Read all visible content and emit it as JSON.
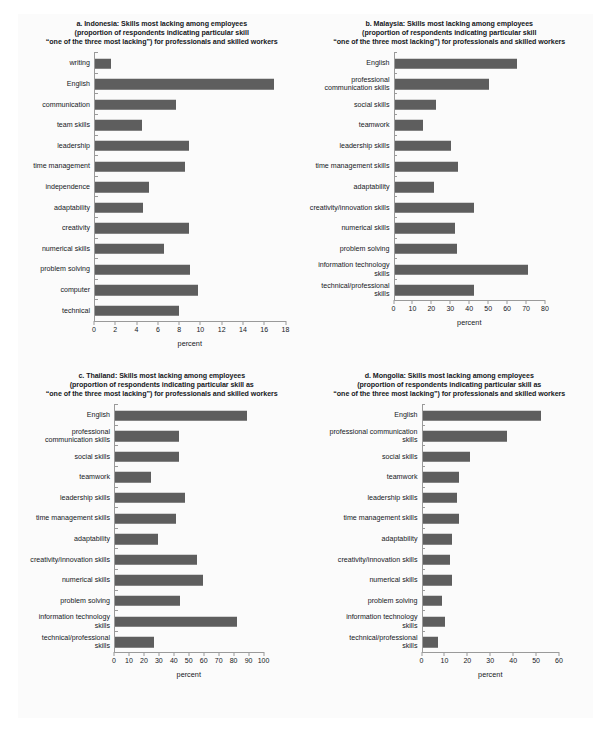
{
  "figure": {
    "bar_color": "#5e5e5e",
    "axis_color": "#9a9a9a",
    "background": "#fbfbfb",
    "page_background": "#ffffff"
  },
  "chart_data": [
    {
      "id": "a",
      "type": "bar",
      "orientation": "horizontal",
      "title_lines": [
        "a. Indonesia: Skills most lacking among employees",
        "(proportion of respondents indicating particular skill",
        "“one of the three most lacking”) for professionals and skilled workers"
      ],
      "xlabel": "percent",
      "ylabel": "",
      "xlim": [
        0,
        18
      ],
      "xticks": [
        0,
        2,
        4,
        6,
        8,
        10,
        12,
        14,
        16,
        18
      ],
      "xtick_labels": [
        "0",
        "2",
        "4",
        "6",
        "8",
        "10",
        "12",
        "14",
        "16",
        "18"
      ],
      "grid": false,
      "legend": "none",
      "categories": [
        "writing",
        "English",
        "communication",
        "team skills",
        "leadership",
        "time management",
        "independence",
        "adaptability",
        "creativity",
        "numerical skills",
        "problem solving",
        "computer",
        "technical"
      ],
      "values": [
        1.5,
        16.9,
        7.7,
        4.4,
        8.9,
        8.5,
        5.1,
        4.5,
        8.9,
        6.5,
        9.0,
        9.7,
        7.9
      ]
    },
    {
      "id": "b",
      "type": "bar",
      "orientation": "horizontal",
      "title_lines": [
        "b. Malaysia: Skills most lacking among employees",
        "(proportion of respondents indicating particular skill",
        "“one of the three most lacking”) for professionals and skilled workers"
      ],
      "xlabel": "percent",
      "ylabel": "",
      "xlim": [
        0,
        80
      ],
      "xticks": [
        0,
        10,
        20,
        30,
        40,
        50,
        60,
        70,
        80
      ],
      "xtick_labels": [
        "0",
        "10",
        "20",
        "30",
        "40",
        "50",
        "60",
        "70",
        "80"
      ],
      "grid": false,
      "legend": "none",
      "categories": [
        "English",
        "professional\ncommunication skills",
        "social skills",
        "teamwork",
        "leadership skills",
        "time management  skills",
        "adaptability",
        "creativity/innovation skills",
        "numerical skills",
        "problem solving",
        "information technology\nskills",
        "technical/professional\nskills"
      ],
      "values": [
        65,
        50,
        22,
        15,
        30,
        34,
        21,
        42,
        32,
        33,
        71,
        42
      ]
    },
    {
      "id": "c",
      "type": "bar",
      "orientation": "horizontal",
      "title_lines": [
        "c. Thailand: Skills most lacking among employees",
        "(proportion of respondents indicating particular skill as",
        "“one of the three most lacking”) for professionals and skilled workers"
      ],
      "xlabel": "percent",
      "ylabel": "",
      "xlim": [
        0,
        100
      ],
      "xticks": [
        0,
        10,
        20,
        30,
        40,
        50,
        60,
        70,
        80,
        90,
        100
      ],
      "xtick_labels": [
        "0",
        "10",
        "20",
        "30",
        "40",
        "50",
        "60",
        "70",
        "80",
        "90",
        "100"
      ],
      "grid": false,
      "legend": "none",
      "categories": [
        "English",
        "professional\ncommunication skills",
        "social skills",
        "teamwork",
        "leadership skills",
        "time management  skills",
        "adaptability",
        "creativity/innovation skills",
        "numerical skills",
        "problem solving",
        "information technology\nskills",
        "technical/professional\nskills"
      ],
      "values": [
        89,
        43,
        43,
        24,
        47,
        41,
        29,
        55,
        59,
        44,
        82,
        26
      ]
    },
    {
      "id": "d",
      "type": "bar",
      "orientation": "horizontal",
      "title_lines": [
        "d. Mongolia: Skills most lacking among employees",
        "(proportion of respondents indicating particular skill as",
        "“one of the three most lacking”) for professionals and skilled workers"
      ],
      "xlabel": "percent",
      "ylabel": "",
      "xlim": [
        0,
        60
      ],
      "xticks": [
        0,
        10,
        20,
        30,
        40,
        50,
        60
      ],
      "xtick_labels": [
        "0",
        "10",
        "20",
        "30",
        "40",
        "50",
        "60"
      ],
      "grid": false,
      "legend": "none",
      "categories": [
        "English",
        "professional communication\nskills",
        "social skills",
        "teamwork",
        "leadership skills",
        "time management skills",
        "adaptability",
        "creativity/innovation skills",
        "numerical skills",
        "problem solving",
        "information technology\nskills",
        "technical/professional\nskills"
      ],
      "values": [
        52,
        37,
        21,
        16,
        15,
        16,
        13,
        12,
        13,
        8.5,
        10,
        7
      ]
    }
  ]
}
